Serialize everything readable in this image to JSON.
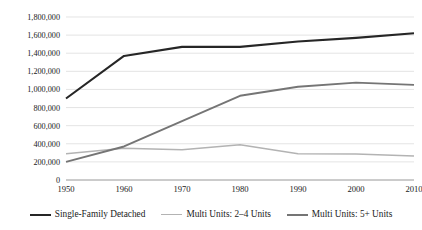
{
  "chart_data": {
    "type": "line",
    "title": "",
    "xlabel": "",
    "ylabel": "",
    "categories": [
      1950,
      1960,
      1970,
      1980,
      1990,
      2000,
      2010
    ],
    "xtick_labels": [
      "1950",
      "1960",
      "1970",
      "1980",
      "1990",
      "2000",
      "2010"
    ],
    "ytick_labels": [
      "0",
      "200,000",
      "400,000",
      "600,000",
      "800,000",
      "1,000,000",
      "1,200,000",
      "1,400,000",
      "1,600,000",
      "1,800,000"
    ],
    "ytick_values": [
      0,
      200000,
      400000,
      600000,
      800000,
      1000000,
      1200000,
      1400000,
      1600000,
      1800000
    ],
    "ylim": [
      0,
      1800000
    ],
    "xlim": [
      1950,
      2010
    ],
    "grid": true,
    "legend_position": "bottom",
    "series": [
      {
        "name": "Single-Family Detached",
        "color": "#262626",
        "width": 2.1,
        "values": [
          900000,
          1370000,
          1470000,
          1470000,
          1530000,
          1570000,
          1620000
        ]
      },
      {
        "name": "Multi Units: 2–4 Units",
        "color": "#b3b3b3",
        "width": 1.5,
        "values": [
          290000,
          350000,
          335000,
          390000,
          290000,
          288000,
          265000
        ]
      },
      {
        "name": "Multi Units: 5+ Units",
        "color": "#757575",
        "width": 1.9,
        "values": [
          200000,
          370000,
          650000,
          930000,
          1030000,
          1075000,
          1050000
        ]
      }
    ]
  },
  "legend": {
    "items": [
      {
        "label": "Single-Family Detached",
        "color": "#262626",
        "width": "2.2px"
      },
      {
        "label": "Multi Units: 2–4 Units",
        "color": "#b3b3b3",
        "width": "1.6px"
      },
      {
        "label": "Multi Units: 5+ Units",
        "color": "#757575",
        "width": "2px"
      }
    ]
  }
}
